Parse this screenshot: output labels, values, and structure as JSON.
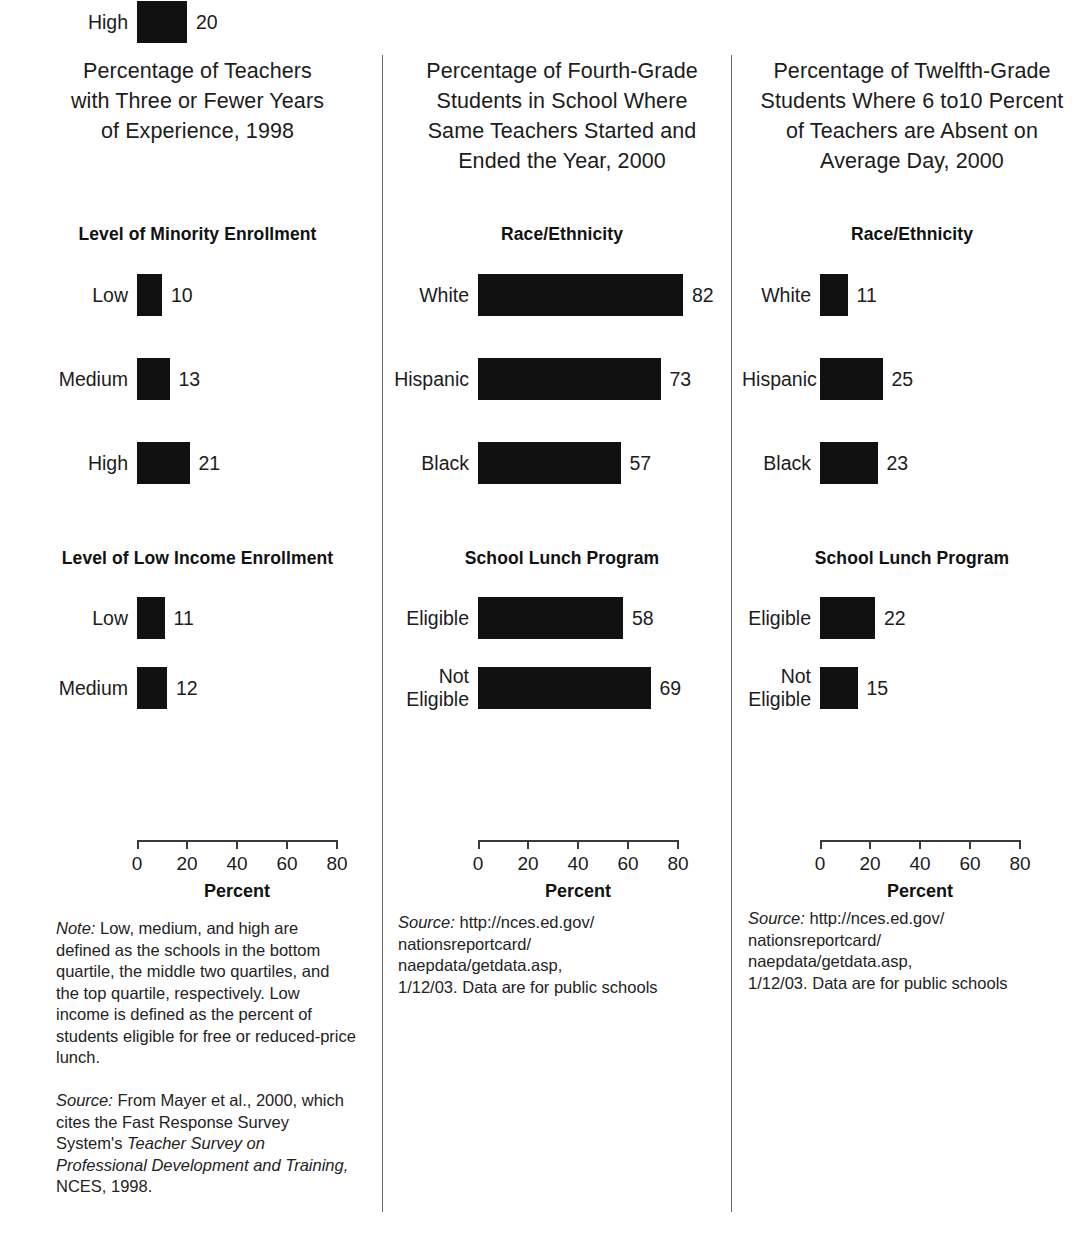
{
  "figure": {
    "axis_caption": "Percent",
    "axis_ticks": [
      "0",
      "20",
      "40",
      "60",
      "80"
    ],
    "bar_color": "#111111",
    "divider_color": "#6b6b6b"
  },
  "chart_data": [
    {
      "type": "bar",
      "orientation": "horizontal",
      "title": "Percentage of Teachers\nwith Three or Fewer Years\nof Experience, 1998",
      "xlabel": "Percent",
      "ylabel": "",
      "xlim": [
        0,
        80
      ],
      "xticks": [
        0,
        20,
        40,
        60,
        80
      ],
      "grid": false,
      "legend": "none",
      "groups": [
        {
          "name": "Level of Minority Enrollment",
          "categories": [
            "Low",
            "Medium",
            "High"
          ],
          "values": [
            10,
            13,
            21
          ]
        },
        {
          "name": "Level of Low Income Enrollment",
          "categories": [
            "Low",
            "Medium",
            "High"
          ],
          "values": [
            11,
            12,
            20
          ]
        }
      ],
      "notes": [
        {
          "lead": "Note:",
          "text": " Low, medium, and high are defined as the schools in the bottom quartile, the middle two quartiles, and the top quartile, respectively. Low income is defined as the percent of students eligible for free or reduced-price lunch."
        }
      ],
      "source": {
        "lead": "Source:",
        "plain_1": " From Mayer et al., 2000, which cites the Fast Response Survey System's ",
        "italic_1": "Teacher Survey on Professional Development and Training,",
        "plain_2": " NCES, 1998."
      }
    },
    {
      "type": "bar",
      "orientation": "horizontal",
      "title": "Percentage of Fourth-Grade\nStudents in School Where\nSame Teachers Started and\nEnded the Year, 2000",
      "xlabel": "Percent",
      "ylabel": "",
      "xlim": [
        0,
        80
      ],
      "xticks": [
        0,
        20,
        40,
        60,
        80
      ],
      "grid": false,
      "legend": "none",
      "groups": [
        {
          "name": "Race/Ethnicity",
          "categories": [
            "White",
            "Hispanic",
            "Black"
          ],
          "values": [
            82,
            73,
            57
          ]
        },
        {
          "name": "School Lunch Program",
          "categories": [
            "Eligible",
            "Not\nEligible"
          ],
          "values": [
            58,
            69
          ]
        }
      ],
      "notes": [],
      "source": {
        "lead": "Source:",
        "plain_1": " http://nces.ed.gov/\nnationsreportcard/\nnaepdata/getdata.asp,\n1/12/03. Data are for public schools",
        "italic_1": "",
        "plain_2": ""
      }
    },
    {
      "type": "bar",
      "orientation": "horizontal",
      "title": "Percentage of Twelfth-Grade\nStudents Where 6 to10 Percent\nof Teachers are Absent on\nAverage Day, 2000",
      "xlabel": "Percent",
      "ylabel": "",
      "xlim": [
        0,
        80
      ],
      "xticks": [
        0,
        20,
        40,
        60,
        80
      ],
      "grid": false,
      "legend": "none",
      "groups": [
        {
          "name": "Race/Ethnicity",
          "categories": [
            "White",
            "Hispanic",
            "Black"
          ],
          "values": [
            11,
            25,
            23
          ]
        },
        {
          "name": "School Lunch Program",
          "categories": [
            "Eligible",
            "Not\nEligible"
          ],
          "values": [
            22,
            15
          ]
        }
      ],
      "notes": [],
      "source": {
        "lead": "Source:",
        "plain_1": " http://nces.ed.gov/\nnationsreportcard/\nnaepdata/getdata.asp,\n1/12/03. Data are for public schools",
        "italic_1": "",
        "plain_2": ""
      }
    }
  ]
}
